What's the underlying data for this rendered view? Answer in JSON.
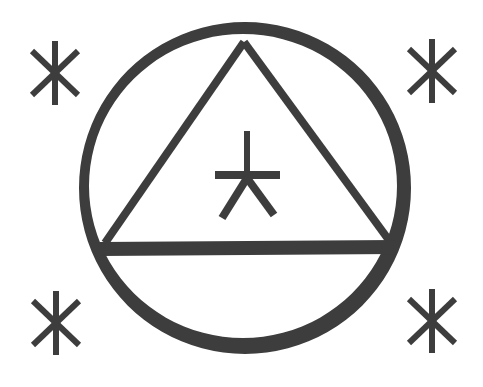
{
  "figure": {
    "ink_color": "#3d3d3d",
    "background": "#ffffff"
  },
  "symbols": {
    "corner_glyphs": [
      "top-left",
      "top-right",
      "bottom-left",
      "bottom-right"
    ],
    "center_glyph": "arrow-cross"
  }
}
